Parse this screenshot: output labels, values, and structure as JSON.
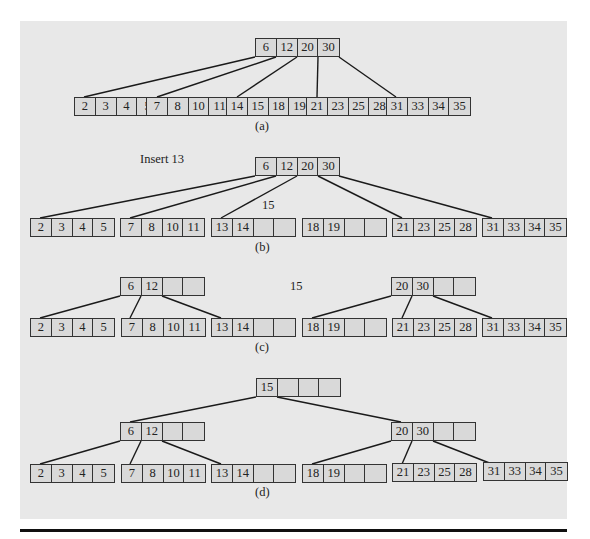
{
  "figure": {
    "annotations": {
      "insert_label": "Insert 13",
      "promoted_key_b": "15",
      "promoted_key_c": "15"
    },
    "captions": {
      "a": "(a)",
      "b": "(b)",
      "c": "(c)",
      "d": "(d)"
    },
    "panels": {
      "a": {
        "root": [
          "6",
          "12",
          "20",
          "30"
        ],
        "leaves": [
          [
            "2",
            "3",
            "4",
            "5"
          ],
          [
            "7",
            "8",
            "10",
            "11"
          ],
          [
            "14",
            "15",
            "18",
            "19"
          ],
          [
            "21",
            "23",
            "25",
            "28"
          ],
          [
            "31",
            "33",
            "34",
            "35"
          ]
        ]
      },
      "b": {
        "root": [
          "6",
          "12",
          "20",
          "30"
        ],
        "leaves": [
          [
            "2",
            "3",
            "4",
            "5"
          ],
          [
            "7",
            "8",
            "10",
            "11"
          ],
          [
            "13",
            "14",
            "",
            ""
          ],
          [
            "18",
            "19",
            "",
            ""
          ],
          [
            "21",
            "23",
            "25",
            "28"
          ],
          [
            "31",
            "33",
            "34",
            "35"
          ]
        ]
      },
      "c": {
        "internal": [
          [
            "6",
            "12",
            "",
            ""
          ],
          [
            "20",
            "30",
            "",
            ""
          ]
        ],
        "leaves": [
          [
            "2",
            "3",
            "4",
            "5"
          ],
          [
            "7",
            "8",
            "10",
            "11"
          ],
          [
            "13",
            "14",
            "",
            ""
          ],
          [
            "18",
            "19",
            "",
            ""
          ],
          [
            "21",
            "23",
            "25",
            "28"
          ],
          [
            "31",
            "33",
            "34",
            "35"
          ]
        ]
      },
      "d": {
        "root": [
          "15",
          "",
          "",
          ""
        ],
        "internal": [
          [
            "6",
            "12",
            "",
            ""
          ],
          [
            "20",
            "30",
            "",
            ""
          ]
        ],
        "leaves": [
          [
            "2",
            "3",
            "4",
            "5"
          ],
          [
            "7",
            "8",
            "10",
            "11"
          ],
          [
            "13",
            "14",
            "",
            ""
          ],
          [
            "18",
            "19",
            "",
            ""
          ],
          [
            "21",
            "23",
            "25",
            "28"
          ],
          [
            "31",
            "33",
            "34",
            "35"
          ]
        ]
      }
    },
    "colors": {
      "panel_background": "#e8e8e8",
      "node_fill": "#d9d9d9",
      "stroke": "#222222"
    }
  }
}
